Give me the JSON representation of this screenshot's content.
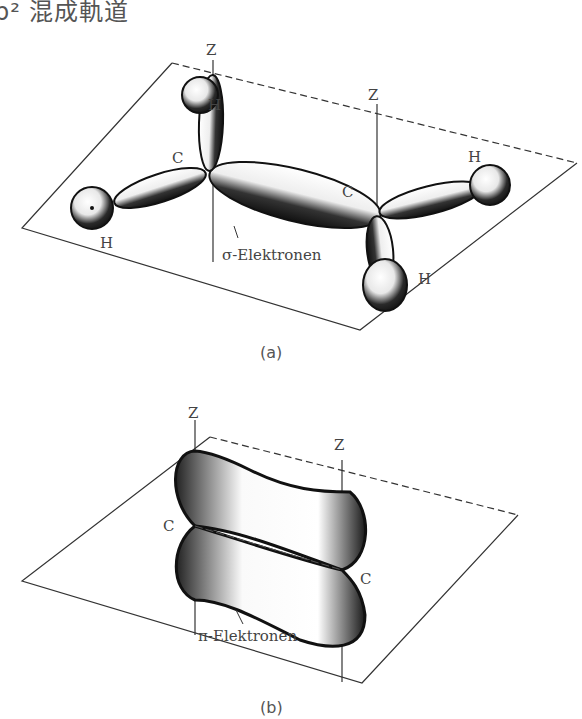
{
  "title": "p² 混成軌道",
  "figures": [
    {
      "id": "a",
      "caption": "(a)",
      "axis_labels": [
        "Z",
        "Z"
      ],
      "atom_labels": {
        "carbon_left": "C",
        "carbon_right": "C",
        "h_top_left": "H",
        "h_left": "H",
        "h_right": "H",
        "h_bottom_right": "H"
      },
      "annotation": "σ-Elektronen"
    },
    {
      "id": "b",
      "caption": "(b)",
      "axis_labels": [
        "Z",
        "Z"
      ],
      "atom_labels": {
        "carbon_left": "C",
        "carbon_right": "C"
      },
      "annotation": "π-Elektronen"
    }
  ]
}
